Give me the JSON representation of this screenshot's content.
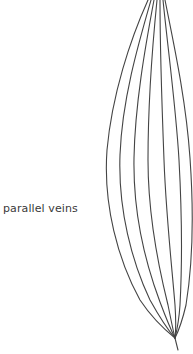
{
  "diagram": {
    "label": "parallel veins",
    "stroke_color": "#444444",
    "vein_count": 7
  }
}
